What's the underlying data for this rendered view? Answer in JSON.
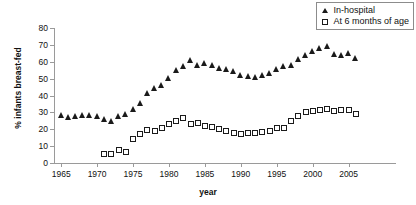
{
  "chart_data": {
    "type": "scatter",
    "title": "",
    "xlabel": "year",
    "ylabel": "% infants breast-fed",
    "xlim": [
      1964,
      2007
    ],
    "ylim": [
      0,
      80
    ],
    "grid": false,
    "legend_position": "top-right",
    "xticks": [
      1965,
      1970,
      1975,
      1980,
      1985,
      1990,
      1995,
      2000,
      2005
    ],
    "yticks": [
      0,
      10,
      20,
      30,
      40,
      50,
      60,
      70,
      80
    ],
    "series": [
      {
        "name": "In-hospital",
        "marker": "filled-triangle",
        "color": "#1a1a1a",
        "x": [
          1965,
          1966,
          1967,
          1968,
          1969,
          1970,
          1971,
          1972,
          1973,
          1974,
          1975,
          1976,
          1977,
          1978,
          1979,
          1980,
          1981,
          1982,
          1983,
          1984,
          1985,
          1986,
          1987,
          1988,
          1989,
          1990,
          1991,
          1992,
          1993,
          1994,
          1995,
          1996,
          1997,
          1998,
          1999,
          2000,
          2001,
          2002,
          2003,
          2004,
          2005,
          2006
        ],
        "values": [
          28,
          27,
          27.5,
          28,
          28,
          27.5,
          26,
          24.5,
          27.5,
          28.5,
          32,
          35,
          41,
          44,
          46,
          50,
          55,
          57,
          61,
          58,
          59,
          58,
          56,
          55.5,
          54,
          52,
          51,
          50.5,
          52,
          53,
          55.5,
          57,
          58,
          61.5,
          64,
          66,
          68,
          69,
          64.5,
          64,
          65,
          62
        ]
      },
      {
        "name": "At 6 months of age",
        "marker": "open-square",
        "color": "#1a1a1a",
        "x": [
          1971,
          1972,
          1973,
          1974,
          1975,
          1976,
          1977,
          1978,
          1979,
          1980,
          1981,
          1982,
          1983,
          1984,
          1985,
          1986,
          1987,
          1988,
          1989,
          1990,
          1991,
          1992,
          1993,
          1994,
          1995,
          1996,
          1997,
          1998,
          1999,
          2000,
          2001,
          2002,
          2003,
          2004,
          2005,
          2006
        ],
        "values": [
          5.5,
          5.5,
          7.5,
          6.5,
          14,
          17,
          19.5,
          19,
          21,
          23,
          25,
          26.5,
          23,
          23.5,
          22,
          21.5,
          20,
          19,
          18,
          17,
          17.5,
          18,
          18.5,
          19,
          21,
          21,
          25,
          28,
          30,
          31,
          31.5,
          32,
          31,
          31.5,
          31.5,
          29
        ]
      }
    ]
  },
  "legend": {
    "items": [
      {
        "label": "In-hospital",
        "marker": "filled-triangle"
      },
      {
        "label": "At 6 months of age",
        "marker": "open-square"
      }
    ]
  }
}
